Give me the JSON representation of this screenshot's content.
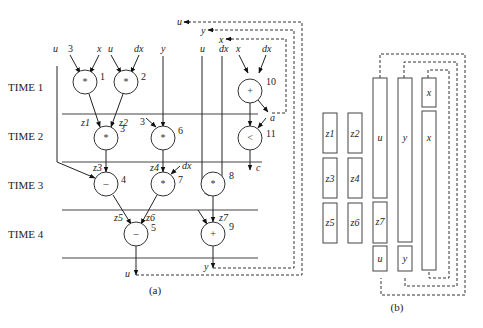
{
  "figure_a": {
    "caption": "(a)",
    "time_steps": [
      {
        "label": "TIME 1",
        "y": 87
      },
      {
        "label": "TIME 2",
        "y": 136
      },
      {
        "label": "TIME 3",
        "y": 185
      },
      {
        "label": "TIME 4",
        "y": 234
      }
    ],
    "time_lines_y": [
      114,
      161,
      209,
      258
    ],
    "nodes": [
      {
        "id": "1",
        "op": "*",
        "cx": 44,
        "cy": 82
      },
      {
        "id": "2",
        "op": "*",
        "cx": 92,
        "cy": 82
      },
      {
        "id": "3",
        "op": "*",
        "cx": 106,
        "cy": 136
      },
      {
        "id": "6",
        "op": "*",
        "cx": 163,
        "cy": 136
      },
      {
        "id": "4",
        "op": "–",
        "cx": 106,
        "cy": 184
      },
      {
        "id": "7",
        "op": "*",
        "cx": 163,
        "cy": 184
      },
      {
        "id": "8",
        "op": "*",
        "cx": 213,
        "cy": 184
      },
      {
        "id": "5",
        "op": "–",
        "cx": 136,
        "cy": 234
      },
      {
        "id": "9",
        "op": "+",
        "cx": 213,
        "cy": 234
      },
      {
        "id": "10",
        "op": "+",
        "cx": 250,
        "cy": 91
      },
      {
        "id": "11",
        "op": "<",
        "cx": 250,
        "cy": 138
      }
    ],
    "inputs_top": [
      "u",
      "3",
      "x",
      "u",
      "dx",
      "y",
      "u",
      "dx",
      "x",
      "dx"
    ],
    "edge_labels": [
      "z1",
      "z2",
      "3",
      "z3",
      "z4",
      "dx",
      "z5",
      "z6",
      "z7",
      "a",
      "c"
    ],
    "outputs": [
      "u",
      "y"
    ],
    "feedback": [
      "u",
      "y",
      "x"
    ]
  },
  "figure_b": {
    "caption": "(b)",
    "registers": [
      {
        "label": "z1"
      },
      {
        "label": "z2"
      },
      {
        "label": "z3"
      },
      {
        "label": "z4"
      },
      {
        "label": "z5"
      },
      {
        "label": "z6"
      },
      {
        "label": "u"
      },
      {
        "label": "y"
      },
      {
        "label": "x"
      },
      {
        "label": "x"
      },
      {
        "label": "z7"
      },
      {
        "label": "u"
      },
      {
        "label": "y"
      }
    ]
  }
}
